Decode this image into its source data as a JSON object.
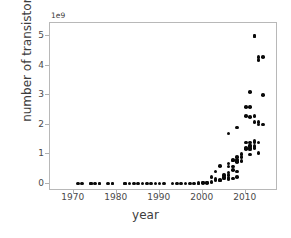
{
  "chart_data": {
    "type": "scatter",
    "title": "",
    "xlabel": "year",
    "ylabel": "number of transistors",
    "y_offset_text": "1e9",
    "y_offset_multiplier": 1000000000,
    "xlim": [
      1964.5,
      2017.5
    ],
    "ylim": [
      -250000000,
      5450000000
    ],
    "xticks": [
      1970,
      1980,
      1990,
      2000,
      2010
    ],
    "xtick_labels": [
      "1970",
      "1980",
      "1990",
      "2000",
      "2010"
    ],
    "yticks": [
      0,
      1000000000,
      2000000000,
      3000000000,
      4000000000,
      5000000000
    ],
    "ytick_labels": [
      "0",
      "1",
      "2",
      "3",
      "4",
      "5"
    ],
    "grid": false,
    "legend": null,
    "marker": "circle",
    "marker_color": "#0a0a0a",
    "marker_size_px": 3.6,
    "points": [
      [
        1971,
        2300
      ],
      [
        1972,
        3500
      ],
      [
        1974,
        4500
      ],
      [
        1974,
        5000
      ],
      [
        1975,
        8000
      ],
      [
        1976,
        6500
      ],
      [
        1976,
        8500
      ],
      [
        1978,
        29000
      ],
      [
        1979,
        29000
      ],
      [
        1979,
        68000
      ],
      [
        1982,
        55000
      ],
      [
        1982,
        134000
      ],
      [
        1983,
        22000
      ],
      [
        1984,
        190000
      ],
      [
        1985,
        275000
      ],
      [
        1986,
        273000
      ],
      [
        1987,
        250000
      ],
      [
        1988,
        275000
      ],
      [
        1989,
        1180000
      ],
      [
        1990,
        1200000
      ],
      [
        1991,
        1185000
      ],
      [
        1993,
        3100000
      ],
      [
        1994,
        2500000
      ],
      [
        1995,
        5500000
      ],
      [
        1996,
        4300000
      ],
      [
        1997,
        7500000
      ],
      [
        1998,
        9300000
      ],
      [
        1999,
        9500000
      ],
      [
        1999,
        21300000
      ],
      [
        2000,
        28000000
      ],
      [
        2000,
        37500000
      ],
      [
        2001,
        25000000
      ],
      [
        2001,
        45000000
      ],
      [
        2002,
        55000000
      ],
      [
        2002,
        220000000
      ],
      [
        2003,
        105000000
      ],
      [
        2003,
        152000000
      ],
      [
        2003,
        410000000
      ],
      [
        2004,
        112000000
      ],
      [
        2004,
        125000000
      ],
      [
        2004,
        592000000
      ],
      [
        2005,
        169000000
      ],
      [
        2005,
        228000000
      ],
      [
        2005,
        291000000
      ],
      [
        2006,
        151000000
      ],
      [
        2006,
        184000000
      ],
      [
        2006,
        291000000
      ],
      [
        2006,
        376000000
      ],
      [
        2006,
        582000000
      ],
      [
        2006,
        681000000
      ],
      [
        2006,
        1700000000
      ],
      [
        2007,
        169000000
      ],
      [
        2007,
        463000000
      ],
      [
        2007,
        582000000
      ],
      [
        2007,
        789000000
      ],
      [
        2007,
        805000000
      ],
      [
        2008,
        230000000
      ],
      [
        2008,
        410000000
      ],
      [
        2008,
        731000000
      ],
      [
        2008,
        758000000
      ],
      [
        2008,
        820000000
      ],
      [
        2008,
        904000000
      ],
      [
        2008,
        1900000000
      ],
      [
        2009,
        774000000
      ],
      [
        2009,
        904000000
      ],
      [
        2009,
        1000000000
      ],
      [
        2010,
        1170000000
      ],
      [
        2010,
        1200000000
      ],
      [
        2010,
        1400000000
      ],
      [
        2010,
        2300000000
      ],
      [
        2010,
        2600000000
      ],
      [
        2011,
        995000000
      ],
      [
        2011,
        1160000000
      ],
      [
        2011,
        1200000000
      ],
      [
        2011,
        1270000000
      ],
      [
        2011,
        1300000000
      ],
      [
        2011,
        1400000000
      ],
      [
        2011,
        2270000000
      ],
      [
        2011,
        2600000000
      ],
      [
        2011,
        3100000000
      ],
      [
        2012,
        1200000000
      ],
      [
        2012,
        1270000000
      ],
      [
        2012,
        1400000000
      ],
      [
        2012,
        1450000000
      ],
      [
        2012,
        2100000000
      ],
      [
        2012,
        2300000000
      ],
      [
        2012,
        5000000000
      ],
      [
        2012,
        5000000000
      ],
      [
        2013,
        1040000000
      ],
      [
        2013,
        1400000000
      ],
      [
        2013,
        2000000000
      ],
      [
        2013,
        2100000000
      ],
      [
        2013,
        4200000000
      ],
      [
        2013,
        4300000000
      ],
      [
        2014,
        2000000000
      ],
      [
        2014,
        3000000000
      ],
      [
        2014,
        4300000000
      ]
    ]
  },
  "axes": {
    "spine_color": "#b8b8b8",
    "tick_color": "#b0b0b0",
    "label_color": "#3d3d3d",
    "tick_label_color": "#4a4a4a",
    "background": "#ffffff"
  }
}
